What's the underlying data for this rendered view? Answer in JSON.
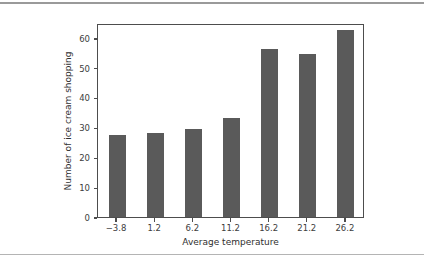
{
  "chart_data": {
    "type": "bar",
    "title": "",
    "xlabel": "Average temperature",
    "ylabel": "Number of ice cream shopping",
    "categories": [
      "−3.8",
      "1.2",
      "6.2",
      "11.2",
      "16.2",
      "21.2",
      "26.2"
    ],
    "values": [
      27.5,
      28.3,
      29.4,
      33.3,
      56.4,
      54.5,
      62.5
    ],
    "ylim": [
      0,
      65
    ],
    "xlim": [
      -6.3,
      28.7
    ],
    "yticks": [
      0,
      10,
      20,
      30,
      40,
      50,
      60
    ],
    "ytick_labels": [
      "0",
      "10",
      "20",
      "30",
      "40",
      "50",
      "60"
    ],
    "grid": false,
    "legend": null,
    "bar_color": "#5a5a5a",
    "axis_color": "#4d4d4d",
    "background_color": "#ffffff"
  }
}
